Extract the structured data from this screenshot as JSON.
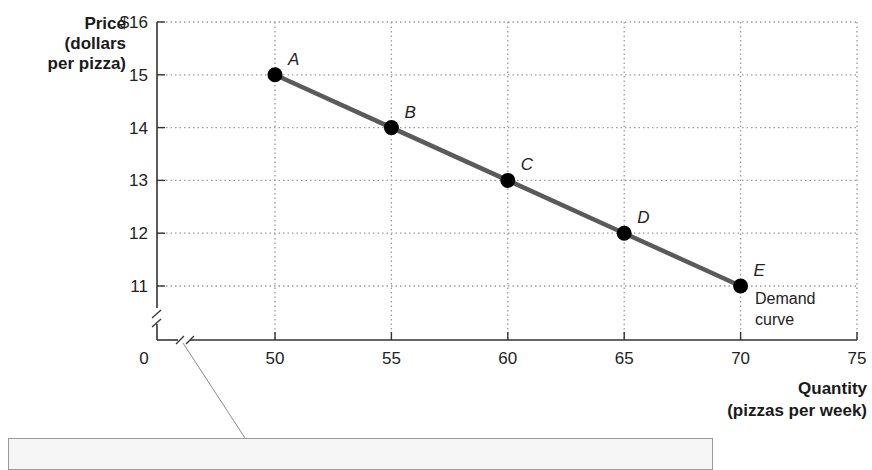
{
  "chart_data": {
    "type": "line",
    "title": "",
    "ylabel": "Price (dollars per pizza)",
    "ylabel_lines": [
      "Price",
      "(dollars",
      "per pizza)"
    ],
    "xlabel": "Quantity (pizzas per week)",
    "xlabel_lines": [
      "Quantity",
      "(pizzas per week)"
    ],
    "x_ticks": [
      "0",
      "50",
      "55",
      "60",
      "65",
      "70",
      "75"
    ],
    "y_ticks": [
      "$16",
      "15",
      "14",
      "13",
      "12",
      "11"
    ],
    "xlim": [
      0,
      75
    ],
    "ylim": [
      0,
      16
    ],
    "axis_breaks": [
      "x",
      "y"
    ],
    "grid": "dotted",
    "series": [
      {
        "name": "Demand curve",
        "points": [
          {
            "label": "A",
            "x": 50,
            "y": 15
          },
          {
            "label": "B",
            "x": 55,
            "y": 14
          },
          {
            "label": "C",
            "x": 60,
            "y": 13
          },
          {
            "label": "D",
            "x": 65,
            "y": 12
          },
          {
            "label": "E",
            "x": 70,
            "y": 11
          }
        ]
      }
    ],
    "annotations": [
      {
        "text": "Demand curve",
        "lines": [
          "Demand",
          "curve"
        ],
        "near": "E"
      }
    ],
    "colors": {
      "line": "#5a5a5a",
      "point": "#000000",
      "grid": "#9a9a9a",
      "axis": "#333333"
    }
  },
  "callout": {
    "text": ""
  }
}
